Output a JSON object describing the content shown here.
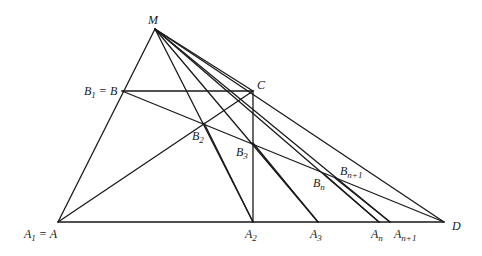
{
  "diagram": {
    "type": "geometric-construction",
    "points": {
      "M": {
        "label": "M"
      },
      "B": {
        "label": "B",
        "prefix": "B",
        "sub": "1",
        "suffix": " = B"
      },
      "C": {
        "label": "C"
      },
      "A": {
        "label": "A",
        "prefix": "A",
        "sub": "1",
        "suffix": " = A"
      },
      "A2": {
        "label": "A",
        "sub": "2"
      },
      "A3": {
        "label": "A",
        "sub": "3"
      },
      "An": {
        "label": "A",
        "sub": "n"
      },
      "An1": {
        "label": "A",
        "sub": "n+1"
      },
      "D": {
        "label": "D"
      },
      "B2": {
        "label": "B",
        "sub": "2"
      },
      "B3": {
        "label": "B",
        "sub": "3"
      },
      "Bn": {
        "label": "B",
        "sub": "n"
      },
      "Bn1": {
        "label": "B",
        "sub": "n+1"
      }
    },
    "segments": [
      [
        "M",
        "A"
      ],
      [
        "A",
        "D"
      ],
      [
        "M",
        "D"
      ],
      [
        "B",
        "C"
      ],
      [
        "C",
        "A2"
      ],
      [
        "A",
        "C"
      ],
      [
        "B",
        "D"
      ],
      [
        "M",
        "A2"
      ],
      [
        "M",
        "A3"
      ],
      [
        "M",
        "An"
      ],
      [
        "M",
        "An1"
      ],
      [
        "M",
        "C"
      ],
      [
        "B2",
        "A2"
      ],
      [
        "B3",
        "A3"
      ],
      [
        "Bn",
        "An"
      ],
      [
        "Bn1",
        "An1"
      ]
    ]
  }
}
